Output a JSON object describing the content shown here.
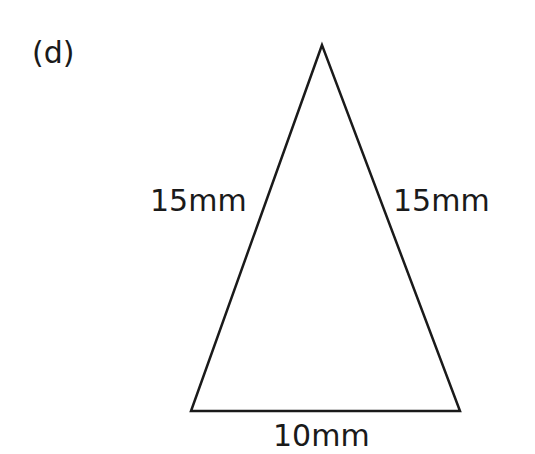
{
  "part_label": "(d)",
  "triangle": {
    "vertices": {
      "apex": [
        322,
        45
      ],
      "bottom_left": [
        191,
        411
      ],
      "bottom_right": [
        460,
        411
      ]
    },
    "stroke_color": "#1a1a1a",
    "sides": {
      "left": "15mm",
      "right": "15mm",
      "base": "10mm"
    }
  }
}
